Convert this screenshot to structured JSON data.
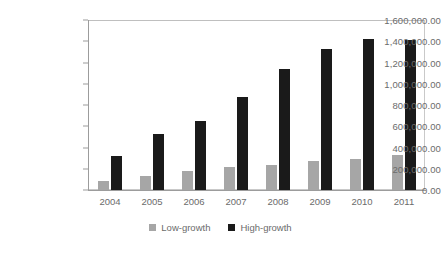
{
  "chart_data": {
    "type": "bar",
    "title": "",
    "xlabel": "",
    "ylabel": "",
    "categories": [
      "2004",
      "2005",
      "2006",
      "2007",
      "2008",
      "2009",
      "2010",
      "2011"
    ],
    "series": [
      {
        "name": "Low-growth",
        "color": "#a6a6a6",
        "values": [
          85000,
          135000,
          180000,
          215000,
          240000,
          270000,
          290000,
          325000
        ]
      },
      {
        "name": "High-growth",
        "color": "#1a1a1a",
        "values": [
          320000,
          525000,
          645000,
          880000,
          1135000,
          1325000,
          1420000,
          1415000
        ]
      }
    ],
    "ylim": [
      0,
      1600000
    ],
    "ytick_values": [
      0,
      200000,
      400000,
      600000,
      800000,
      1000000,
      1200000,
      1400000,
      1600000
    ],
    "ytick_labels": [
      "0.00",
      "200,000.00",
      "400,000.00",
      "600,000.00",
      "800,000.00",
      "1,000,000.00",
      "1,200,000.00",
      "1,400,000.00",
      "1,600,000.00"
    ],
    "grid": false,
    "legend_position": "bottom",
    "plot_background": "#ffffff",
    "axis_color": "#9c9c9c",
    "tick_label_color": "#6b6b6b"
  }
}
